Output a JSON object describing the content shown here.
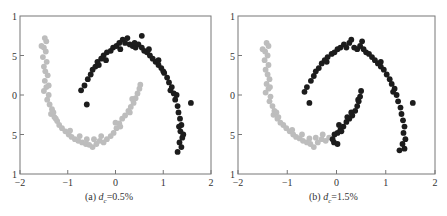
{
  "chart_data": [
    {
      "type": "scatter",
      "title": "",
      "caption_prefix": "(a)",
      "caption_var": "d",
      "caption_sub": "c",
      "caption_value": "=0.5%",
      "xlabel": "",
      "ylabel": "",
      "xlim": [
        -2,
        2
      ],
      "ylim": [
        -1,
        1
      ],
      "x_ticks": [
        "-2",
        "-1",
        "0",
        "1",
        "2"
      ],
      "y_ticks_visible": [
        "1",
        "5",
        "0",
        "5",
        "1"
      ],
      "grid": false,
      "series": [
        {
          "name": "cluster-1",
          "color": "#bdbdbd",
          "points": [
            [
              -1.48,
              0.72
            ],
            [
              -1.45,
              0.68
            ],
            [
              -1.5,
              0.6
            ],
            [
              -1.46,
              0.55
            ],
            [
              -1.52,
              0.48
            ],
            [
              -1.44,
              0.42
            ],
            [
              -1.5,
              0.36
            ],
            [
              -1.47,
              0.3
            ],
            [
              -1.42,
              0.25
            ],
            [
              -1.48,
              0.18
            ],
            [
              -1.45,
              0.1
            ],
            [
              -1.5,
              0.05
            ],
            [
              -1.4,
              0.0
            ],
            [
              -1.43,
              -0.06
            ],
            [
              -1.38,
              -0.12
            ],
            [
              -1.33,
              -0.18
            ],
            [
              -1.35,
              -0.24
            ],
            [
              -1.28,
              -0.28
            ],
            [
              -1.22,
              -0.33
            ],
            [
              -1.18,
              -0.38
            ],
            [
              -1.12,
              -0.42
            ],
            [
              -1.05,
              -0.46
            ],
            [
              -0.98,
              -0.5
            ],
            [
              -0.92,
              -0.53
            ],
            [
              -0.85,
              -0.56
            ],
            [
              -0.78,
              -0.58
            ],
            [
              -0.7,
              -0.6
            ],
            [
              -0.62,
              -0.62
            ],
            [
              -0.55,
              -0.63
            ],
            [
              -0.48,
              -0.66
            ],
            [
              -0.4,
              -0.62
            ],
            [
              -0.33,
              -0.58
            ],
            [
              -0.25,
              -0.6
            ],
            [
              -0.18,
              -0.56
            ],
            [
              -0.1,
              -0.52
            ],
            [
              -0.04,
              -0.48
            ],
            [
              0.02,
              -0.42
            ],
            [
              0.08,
              -0.36
            ],
            [
              0.14,
              -0.3
            ],
            [
              0.2,
              -0.26
            ],
            [
              0.27,
              -0.2
            ],
            [
              0.32,
              -0.15
            ],
            [
              0.38,
              -0.1
            ],
            [
              0.42,
              -0.04
            ],
            [
              0.46,
              0.02
            ],
            [
              0.5,
              0.08
            ],
            [
              0.52,
              0.13
            ],
            [
              -1.55,
              0.62
            ],
            [
              -1.3,
              -0.22
            ],
            [
              -0.95,
              -0.45
            ],
            [
              -0.6,
              -0.56
            ],
            [
              -0.3,
              -0.52
            ],
            [
              0.1,
              -0.4
            ],
            [
              0.3,
              -0.22
            ],
            [
              -1.25,
              -0.3
            ],
            [
              -0.75,
              -0.52
            ],
            [
              -0.45,
              -0.56
            ],
            [
              0.0,
              -0.35
            ],
            [
              0.35,
              -0.05
            ],
            [
              -1.4,
              0.12
            ]
          ]
        },
        {
          "name": "cluster-2",
          "color": "#1c1c1c",
          "points": [
            [
              -0.72,
              0.06
            ],
            [
              -0.65,
              0.12
            ],
            [
              -0.6,
              -0.12
            ],
            [
              -0.58,
              0.2
            ],
            [
              -0.52,
              0.26
            ],
            [
              -0.48,
              0.32
            ],
            [
              -0.42,
              0.36
            ],
            [
              -0.38,
              0.42
            ],
            [
              -0.3,
              0.46
            ],
            [
              -0.25,
              0.5
            ],
            [
              -0.18,
              0.54
            ],
            [
              -0.1,
              0.56
            ],
            [
              -0.05,
              0.6
            ],
            [
              0.02,
              0.62
            ],
            [
              0.08,
              0.66
            ],
            [
              0.15,
              0.7
            ],
            [
              0.2,
              0.66
            ],
            [
              0.25,
              0.72
            ],
            [
              0.3,
              0.64
            ],
            [
              0.36,
              0.62
            ],
            [
              0.42,
              0.6
            ],
            [
              0.48,
              0.64
            ],
            [
              0.55,
              0.6
            ],
            [
              0.6,
              0.56
            ],
            [
              0.66,
              0.54
            ],
            [
              0.72,
              0.5
            ],
            [
              0.78,
              0.46
            ],
            [
              0.84,
              0.42
            ],
            [
              0.9,
              0.38
            ],
            [
              0.96,
              0.34
            ],
            [
              1.02,
              0.28
            ],
            [
              1.08,
              0.22
            ],
            [
              1.12,
              0.16
            ],
            [
              1.18,
              0.1
            ],
            [
              1.22,
              0.02
            ],
            [
              1.25,
              -0.06
            ],
            [
              1.3,
              -0.14
            ],
            [
              1.32,
              -0.22
            ],
            [
              1.35,
              -0.3
            ],
            [
              1.38,
              -0.38
            ],
            [
              1.36,
              -0.46
            ],
            [
              1.4,
              -0.54
            ],
            [
              1.34,
              -0.6
            ],
            [
              1.38,
              -0.66
            ],
            [
              1.42,
              -0.5
            ],
            [
              1.58,
              -0.1
            ],
            [
              0.55,
              0.75
            ],
            [
              0.1,
              0.58
            ],
            [
              -0.2,
              0.44
            ],
            [
              0.7,
              0.58
            ],
            [
              1.0,
              0.3
            ],
            [
              1.28,
              0.0
            ],
            [
              1.3,
              -0.72
            ],
            [
              -0.35,
              0.38
            ],
            [
              0.4,
              0.66
            ],
            [
              0.9,
              0.44
            ],
            [
              1.15,
              0.06
            ],
            [
              1.33,
              -0.4
            ]
          ]
        }
      ]
    },
    {
      "type": "scatter",
      "title": "",
      "caption_prefix": "(b)",
      "caption_var": "d",
      "caption_sub": "c",
      "caption_value": "=1.5%",
      "xlabel": "",
      "ylabel": "",
      "xlim": [
        -2,
        2
      ],
      "ylim": [
        -1,
        1
      ],
      "x_ticks": [
        "-2",
        "-1",
        "0",
        "1",
        "2"
      ],
      "y_ticks_visible": [
        "1",
        "5",
        "0",
        "5",
        "1"
      ],
      "grid": false,
      "series": [
        {
          "name": "cluster-1",
          "color": "#bdbdbd",
          "points": [
            [
              -1.42,
              0.66
            ],
            [
              -1.38,
              0.62
            ],
            [
              -1.45,
              0.55
            ],
            [
              -1.4,
              0.5
            ],
            [
              -1.46,
              0.44
            ],
            [
              -1.38,
              0.38
            ],
            [
              -1.44,
              0.32
            ],
            [
              -1.4,
              0.26
            ],
            [
              -1.36,
              0.2
            ],
            [
              -1.42,
              0.14
            ],
            [
              -1.38,
              0.08
            ],
            [
              -1.44,
              0.03
            ],
            [
              -1.34,
              -0.02
            ],
            [
              -1.36,
              -0.08
            ],
            [
              -1.3,
              -0.14
            ],
            [
              -1.26,
              -0.2
            ],
            [
              -1.28,
              -0.25
            ],
            [
              -1.2,
              -0.3
            ],
            [
              -1.14,
              -0.35
            ],
            [
              -1.08,
              -0.38
            ],
            [
              -1.02,
              -0.42
            ],
            [
              -0.95,
              -0.46
            ],
            [
              -0.88,
              -0.5
            ],
            [
              -0.82,
              -0.53
            ],
            [
              -0.75,
              -0.55
            ],
            [
              -0.68,
              -0.58
            ],
            [
              -0.6,
              -0.6
            ],
            [
              -0.53,
              -0.62
            ],
            [
              -0.46,
              -0.66
            ],
            [
              -0.38,
              -0.6
            ],
            [
              -0.3,
              -0.56
            ],
            [
              -0.22,
              -0.58
            ],
            [
              -0.15,
              -0.54
            ],
            [
              -1.5,
              0.58
            ],
            [
              -1.22,
              -0.22
            ],
            [
              -0.9,
              -0.44
            ],
            [
              -0.55,
              -0.55
            ],
            [
              -0.28,
              -0.5
            ],
            [
              -1.18,
              -0.28
            ],
            [
              -0.7,
              -0.5
            ],
            [
              -0.42,
              -0.54
            ],
            [
              -1.35,
              0.1
            ]
          ]
        },
        {
          "name": "cluster-2",
          "color": "#1c1c1c",
          "points": [
            [
              -0.65,
              0.04
            ],
            [
              -0.6,
              0.1
            ],
            [
              -0.55,
              -0.1
            ],
            [
              -0.52,
              0.18
            ],
            [
              -0.46,
              0.24
            ],
            [
              -0.42,
              0.3
            ],
            [
              -0.36,
              0.34
            ],
            [
              -0.3,
              0.4
            ],
            [
              -0.24,
              0.44
            ],
            [
              -0.18,
              0.48
            ],
            [
              -0.1,
              0.52
            ],
            [
              -0.04,
              0.54
            ],
            [
              0.02,
              0.58
            ],
            [
              0.08,
              0.6
            ],
            [
              0.15,
              0.64
            ],
            [
              0.2,
              0.6
            ],
            [
              0.26,
              0.66
            ],
            [
              0.3,
              0.7
            ],
            [
              0.36,
              0.6
            ],
            [
              0.42,
              0.58
            ],
            [
              0.48,
              0.62
            ],
            [
              0.55,
              0.58
            ],
            [
              0.6,
              0.54
            ],
            [
              0.66,
              0.52
            ],
            [
              0.72,
              0.48
            ],
            [
              0.78,
              0.44
            ],
            [
              0.84,
              0.4
            ],
            [
              0.9,
              0.36
            ],
            [
              0.96,
              0.32
            ],
            [
              1.02,
              0.26
            ],
            [
              1.08,
              0.2
            ],
            [
              1.12,
              0.14
            ],
            [
              1.18,
              0.08
            ],
            [
              1.22,
              0.0
            ],
            [
              1.25,
              -0.08
            ],
            [
              1.3,
              -0.16
            ],
            [
              1.32,
              -0.24
            ],
            [
              1.35,
              -0.32
            ],
            [
              1.38,
              -0.4
            ],
            [
              1.36,
              -0.48
            ],
            [
              1.4,
              -0.56
            ],
            [
              1.34,
              -0.62
            ],
            [
              1.38,
              -0.68
            ],
            [
              1.55,
              -0.1
            ],
            [
              0.52,
              0.68
            ],
            [
              0.5,
              0.05
            ],
            [
              0.48,
              -0.02
            ],
            [
              0.45,
              -0.08
            ],
            [
              0.42,
              -0.14
            ],
            [
              0.38,
              -0.2
            ],
            [
              0.32,
              -0.26
            ],
            [
              0.26,
              -0.3
            ],
            [
              0.2,
              -0.34
            ],
            [
              0.14,
              -0.4
            ],
            [
              0.08,
              -0.44
            ],
            [
              0.02,
              -0.48
            ],
            [
              -0.04,
              -0.5
            ],
            [
              -0.08,
              -0.56
            ],
            [
              -0.05,
              -0.6
            ],
            [
              0.02,
              -0.62
            ],
            [
              0.1,
              -0.46
            ],
            [
              0.3,
              -0.22
            ],
            [
              0.44,
              -0.06
            ],
            [
              0.05,
              -0.38
            ],
            [
              0.22,
              -0.28
            ],
            [
              0.9,
              0.42
            ],
            [
              1.15,
              0.04
            ],
            [
              -0.2,
              0.42
            ],
            [
              1.28,
              -0.7
            ]
          ]
        }
      ]
    }
  ]
}
